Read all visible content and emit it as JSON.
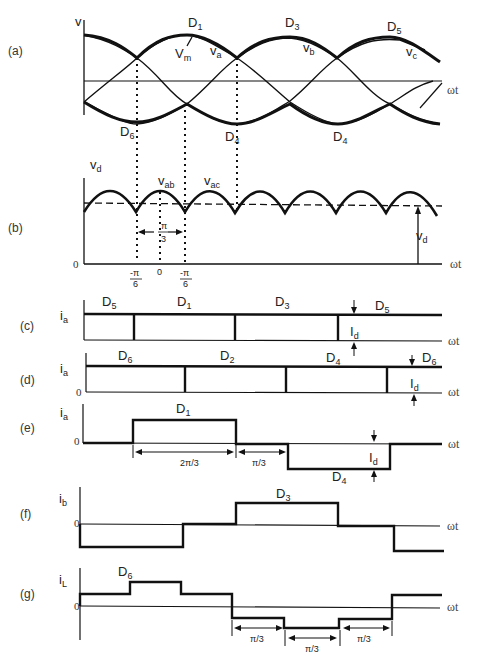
{
  "figure": {
    "panels": [
      {
        "id": "a",
        "label": "(a)",
        "y_label": "v",
        "x_label": "ωt",
        "annotations": {
          "top": [
            "D1",
            "D3",
            "D5"
          ],
          "bottom": [
            "D6",
            "D4",
            "D4"
          ],
          "curves": [
            "va",
            "vb",
            "vc"
          ],
          "peak": "Vm"
        }
      },
      {
        "id": "b",
        "label": "(b)",
        "y_label": "vd",
        "x_label": "ωt",
        "annotations": {
          "segments": [
            "vab",
            "vac"
          ],
          "mean": "Vd",
          "interval": "π/3",
          "ticks": [
            "-π/6",
            "0",
            "-π/6"
          ],
          "origin": "0"
        }
      },
      {
        "id": "c",
        "label": "(c)",
        "y_label": "ia",
        "x_label": "ωt",
        "annotations": {
          "diodes": [
            "D5",
            "D1",
            "D3",
            "D5"
          ],
          "amplitude": "Id"
        }
      },
      {
        "id": "d",
        "label": "(d)",
        "y_label": "ia",
        "x_label": "ωt",
        "annotations": {
          "diodes": [
            "D6",
            "D2",
            "D4",
            "D6"
          ],
          "amplitude": "Id",
          "origin": "0"
        }
      },
      {
        "id": "e",
        "label": "(e)",
        "y_label": "ia",
        "x_label": "ωt",
        "annotations": {
          "diodes": [
            "D1",
            "D4"
          ],
          "amplitude": "Id",
          "origin": "0",
          "intervals": [
            "2π/3",
            "π/3"
          ]
        }
      },
      {
        "id": "f",
        "label": "(f)",
        "y_label": "ib",
        "x_label": "ωt",
        "annotations": {
          "diodes": [
            "D3"
          ],
          "origin": "0"
        }
      },
      {
        "id": "g",
        "label": "(g)",
        "y_label": "iL",
        "x_label": "ωt",
        "annotations": {
          "diodes": [
            "D6"
          ],
          "origin": "0",
          "intervals": [
            "π/3",
            "π/3",
            "π/3"
          ]
        }
      }
    ]
  },
  "text": {
    "panel_a": "(a)",
    "panel_b": "(b)",
    "panel_c": "(c)",
    "panel_d": "(d)",
    "panel_e": "(e)",
    "panel_f": "(f)",
    "panel_g": "(g)",
    "v": "v",
    "wt": "ωt",
    "zero": "0",
    "oh": "0",
    "D": "D",
    "I": "I",
    "V": "V",
    "s1": "1",
    "s2": "2",
    "s3": "3",
    "s4": "4",
    "s5": "5",
    "s6": "6",
    "sa": "a",
    "sb": "b",
    "sc": "c",
    "sd": "d",
    "sm": "m",
    "sL": "L",
    "sab": "ab",
    "sac": "ac",
    "i": "i",
    "pi": "π",
    "three": "3",
    "six": "6",
    "neg_pi": "-π",
    "two_pi_3": "2π/3",
    "pi_3": "π/3"
  },
  "colors": {
    "line": "#111111",
    "thin": "#222222",
    "background": "#ffffff"
  }
}
